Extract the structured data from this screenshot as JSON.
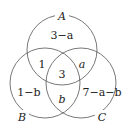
{
  "diagram": {
    "type": "venn-3",
    "stroke_color": "#555555",
    "sets": [
      {
        "name": "A",
        "cx": 62,
        "cy": 50,
        "r": 35,
        "label_x": 62,
        "label_y": 19
      },
      {
        "name": "B",
        "cx": 45,
        "cy": 83,
        "r": 35,
        "label_x": 22,
        "label_y": 120
      },
      {
        "name": "C",
        "cx": 81,
        "cy": 83,
        "r": 35,
        "label_x": 102,
        "label_y": 120
      }
    ],
    "regions": {
      "A_only": "3−a",
      "A_and_B_only": "1",
      "A_and_C_only": "a",
      "A_B_C": "3",
      "B_only": "1−b",
      "B_and_C_only": "b",
      "C_only": "7−a−b"
    }
  }
}
